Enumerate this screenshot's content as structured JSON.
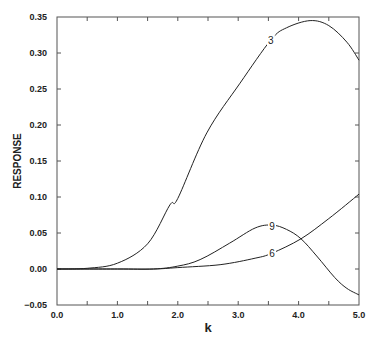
{
  "chart_data": {
    "type": "line",
    "title": "",
    "xlabel": "k",
    "ylabel": "RESPONSE",
    "xlim": [
      0.0,
      5.0
    ],
    "ylim": [
      -0.05,
      0.35
    ],
    "grid": false,
    "legend": "none (inline curve labels)",
    "x_ticks": [
      "0.0",
      "1.0",
      "2.0",
      "3.0",
      "4.0",
      "5.0"
    ],
    "y_ticks": [
      "-0.05",
      "0.00",
      "0.05",
      "0.10",
      "0.15",
      "0.20",
      "0.25",
      "0.30",
      "0.35"
    ],
    "series": [
      {
        "name": "3",
        "label_at": [
          3.54,
          0.318
        ],
        "x": [
          0.0,
          0.5,
          1.0,
          1.5,
          1.87,
          2.0,
          2.48,
          3.03,
          3.54,
          3.8,
          4.19,
          4.5,
          4.8,
          5.0
        ],
        "y": [
          0.0,
          0.001,
          0.008,
          0.035,
          0.089,
          0.098,
          0.189,
          0.258,
          0.318,
          0.335,
          0.345,
          0.338,
          0.315,
          0.29
        ]
      },
      {
        "name": "9",
        "label_at": [
          3.56,
          0.06
        ],
        "x": [
          0.0,
          1.0,
          1.6,
          2.0,
          2.37,
          2.86,
          3.28,
          3.56,
          3.8,
          4.04,
          4.3,
          4.6,
          4.8,
          5.0
        ],
        "y": [
          0.0,
          0.0,
          0.0,
          0.004,
          0.013,
          0.036,
          0.057,
          0.061,
          0.055,
          0.042,
          0.018,
          -0.012,
          -0.027,
          -0.036
        ]
      },
      {
        "name": "6",
        "label_at": [
          3.56,
          0.022
        ],
        "x": [
          0.0,
          1.0,
          1.6,
          2.0,
          2.7,
          3.28,
          3.56,
          4.04,
          4.5,
          5.0
        ],
        "y": [
          0.0,
          0.0,
          0.0,
          0.002,
          0.006,
          0.015,
          0.022,
          0.042,
          0.07,
          0.104
        ]
      }
    ]
  }
}
